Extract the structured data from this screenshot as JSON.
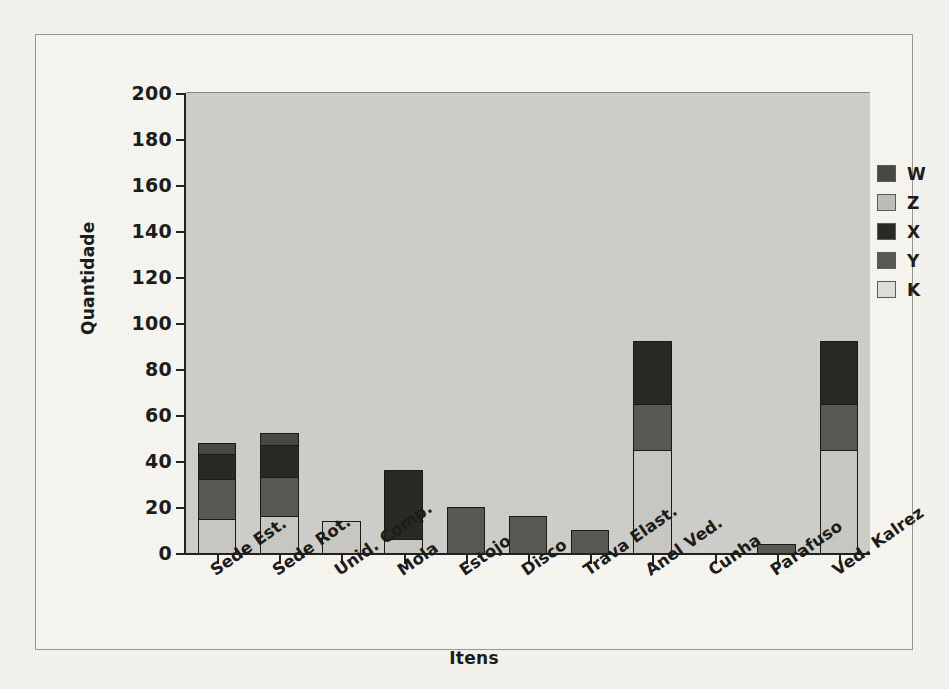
{
  "chart_data": {
    "type": "bar",
    "stacked": true,
    "title": "",
    "xlabel": "Itens",
    "ylabel": "Quantidade",
    "ylim": [
      0,
      200
    ],
    "yticks": [
      0,
      20,
      40,
      60,
      80,
      100,
      120,
      140,
      160,
      180,
      200
    ],
    "grid": false,
    "legend_position": "right",
    "plot_background": "#d2d2cd",
    "categories": [
      "Sede Est.",
      "Sede Rot.",
      "Unid. Comp.",
      "Mola",
      "Estojo",
      "Disco",
      "Trava Elast.",
      "Anel Ved.",
      "Cunha",
      "Parafuso",
      "Ved. Kalrez"
    ],
    "series": [
      {
        "name": "K",
        "color": "#cccbc6",
        "values": [
          15,
          16,
          14,
          6,
          0,
          0,
          0,
          45,
          0,
          0,
          45
        ]
      },
      {
        "name": "Y",
        "color": "#5a5a56",
        "values": [
          17,
          17,
          0,
          0,
          20,
          16,
          10,
          20,
          0,
          4,
          20
        ]
      },
      {
        "name": "X",
        "color": "#2a2a27",
        "values": [
          11,
          14,
          0,
          30,
          0,
          0,
          0,
          27,
          0,
          0,
          27
        ]
      },
      {
        "name": "Z",
        "color": "#c2c1bc",
        "values": [
          0,
          0,
          0,
          0,
          0,
          0,
          0,
          0,
          0,
          0,
          0
        ]
      },
      {
        "name": "W",
        "color": "#494945",
        "values": [
          5,
          5,
          0,
          0,
          0,
          0,
          0,
          0,
          0,
          0,
          0
        ]
      }
    ],
    "totals": [
      48,
      52,
      14,
      36,
      20,
      16,
      10,
      92,
      0,
      4,
      92
    ],
    "legend_entries": [
      {
        "label": "W",
        "color": "#494945"
      },
      {
        "label": "Z",
        "color": "#c2c1bc"
      },
      {
        "label": "X",
        "color": "#2a2a27"
      },
      {
        "label": "Y",
        "color": "#5a5a56"
      },
      {
        "label": "K",
        "color": "#e2e1dc"
      }
    ]
  }
}
